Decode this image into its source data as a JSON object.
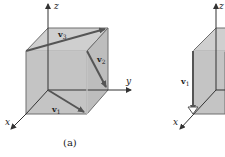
{
  "figures": [
    {
      "id": "a",
      "caption": "(a)",
      "axes": {
        "x": "x",
        "y": "y",
        "z": "z"
      },
      "vectors": [
        {
          "label": "v",
          "subscript": "1"
        },
        {
          "label": "v",
          "subscript": "2"
        },
        {
          "label": "v",
          "subscript": "3"
        }
      ]
    },
    {
      "id": "b",
      "axes": {
        "x": "x",
        "z": "z"
      },
      "vectors": [
        {
          "label": "v",
          "subscript": "1"
        }
      ]
    }
  ],
  "colors": {
    "cube_fill": "#c8c8c8",
    "cube_edge": "#6e6e6e",
    "vector": "#555555",
    "axis": "#333333",
    "hidden_edge": "#f2f2f2"
  }
}
